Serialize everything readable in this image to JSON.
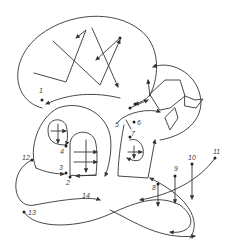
{
  "diagram": {
    "colors": {
      "ink": "#333333",
      "background": "#ffffff"
    },
    "labels": [
      {
        "id": "1",
        "text": "1",
        "x": 39,
        "y": 93
      },
      {
        "id": "2",
        "text": "2",
        "x": 66,
        "y": 183
      },
      {
        "id": "3",
        "text": "3",
        "x": 60,
        "y": 170
      },
      {
        "id": "4",
        "text": "4",
        "x": 60,
        "y": 152
      },
      {
        "id": "5",
        "text": "5",
        "x": 115,
        "y": 127
      },
      {
        "id": "6",
        "text": "6",
        "x": 137,
        "y": 125
      },
      {
        "id": "7",
        "text": "7",
        "x": 131,
        "y": 140
      },
      {
        "id": "8",
        "text": "8",
        "x": 155,
        "y": 190
      },
      {
        "id": "9",
        "text": "9",
        "x": 177,
        "y": 170
      },
      {
        "id": "10",
        "text": "10",
        "x": 194,
        "y": 160
      },
      {
        "id": "11",
        "text": "11",
        "x": 214,
        "y": 155
      },
      {
        "id": "12",
        "text": "12",
        "x": 22,
        "y": 160
      },
      {
        "id": "13",
        "text": "13",
        "x": 28,
        "y": 213
      },
      {
        "id": "14",
        "text": "14",
        "x": 82,
        "y": 197
      }
    ]
  }
}
